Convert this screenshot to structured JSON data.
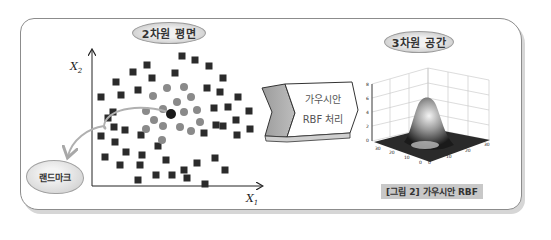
{
  "left_panel": {
    "title": "2차원 평면",
    "x_axis_label": "X",
    "x_axis_sub": "1",
    "y_axis_label": "X",
    "y_axis_sub": "2",
    "landmark_label": "랜드마크",
    "squares": [
      [
        147,
        65
      ],
      [
        133,
        72
      ],
      [
        152,
        78
      ],
      [
        175,
        73
      ],
      [
        116,
        82
      ],
      [
        138,
        90
      ],
      [
        121,
        95
      ],
      [
        101,
        97
      ],
      [
        113,
        112
      ],
      [
        182,
        56
      ],
      [
        195,
        60
      ],
      [
        209,
        66
      ],
      [
        223,
        78
      ],
      [
        207,
        88
      ],
      [
        220,
        92
      ],
      [
        238,
        97
      ],
      [
        214,
        108
      ],
      [
        228,
        107
      ],
      [
        249,
        111
      ],
      [
        250,
        129
      ],
      [
        236,
        120
      ],
      [
        223,
        126
      ],
      [
        216,
        125
      ],
      [
        237,
        135
      ],
      [
        204,
        133
      ],
      [
        108,
        118
      ],
      [
        114,
        127
      ],
      [
        101,
        136
      ],
      [
        125,
        130
      ],
      [
        141,
        135
      ],
      [
        115,
        142
      ],
      [
        126,
        152
      ],
      [
        105,
        157
      ],
      [
        120,
        165
      ],
      [
        142,
        155
      ],
      [
        158,
        146
      ],
      [
        140,
        165
      ],
      [
        166,
        160
      ],
      [
        156,
        175
      ],
      [
        138,
        180
      ],
      [
        172,
        175
      ],
      [
        184,
        170
      ],
      [
        197,
        163
      ],
      [
        215,
        158
      ],
      [
        225,
        170
      ],
      [
        205,
        184
      ],
      [
        187,
        178
      ]
    ],
    "circles": [
      [
        167,
        88
      ],
      [
        184,
        87
      ],
      [
        153,
        96
      ],
      [
        191,
        97
      ],
      [
        177,
        102
      ],
      [
        146,
        111
      ],
      [
        163,
        109
      ],
      [
        184,
        112
      ],
      [
        197,
        110
      ],
      [
        154,
        120
      ],
      [
        163,
        126
      ],
      [
        180,
        127
      ],
      [
        200,
        122
      ],
      [
        146,
        129
      ],
      [
        191,
        131
      ],
      [
        162,
        140
      ]
    ],
    "landmark_point": [
      171,
      114
    ]
  },
  "process_box": {
    "line1": "가우시안",
    "line2": "RBF 처리"
  },
  "right_panel": {
    "title": "3차원 공간",
    "caption": "[그림 2] 가우시안 RBF",
    "z_ticks": [
      "8",
      "6",
      "4",
      "2",
      "0"
    ],
    "x_ticks": [
      "30",
      "20",
      "10",
      "0"
    ],
    "y_ticks": [
      "0",
      "10",
      "20",
      "30"
    ]
  },
  "chart_data": {
    "type": "diagram",
    "title": "가우시안 RBF",
    "panels": [
      {
        "name": "2차원 평면",
        "type": "scatter",
        "xlabel": "X1",
        "ylabel": "X2",
        "series": [
          {
            "name": "class-square",
            "marker": "square",
            "count": 47
          },
          {
            "name": "class-circle",
            "marker": "circle",
            "count": 16
          },
          {
            "name": "landmark",
            "marker": "circle-dark",
            "count": 1
          }
        ]
      },
      {
        "name": "3차원 공간",
        "type": "surface",
        "zlim": [
          0,
          8
        ],
        "xlim": [
          0,
          30
        ],
        "ylim": [
          0,
          30
        ],
        "z_ticks": [
          0,
          2,
          4,
          6,
          8
        ],
        "x_ticks": [
          0,
          10,
          20,
          30
        ],
        "y_ticks": [
          0,
          10,
          20,
          30
        ],
        "description": "Gaussian bump peaked near center (~7) on flat base"
      }
    ]
  }
}
